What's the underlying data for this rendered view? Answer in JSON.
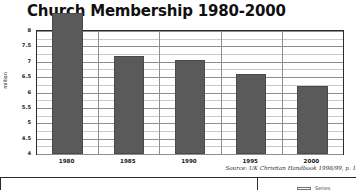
{
  "chart_data": {
    "type": "bar",
    "title": "Church Membership 1980-2000",
    "xlabel": "",
    "ylabel": "million",
    "categories": [
      "1980",
      "1985",
      "1990",
      "1995",
      "2000"
    ],
    "values": [
      8.6,
      7.2,
      7.05,
      6.6,
      6.2
    ],
    "ylim": [
      4,
      8
    ],
    "ytick_labels": [
      "8",
      "7.5",
      "7",
      "6.5",
      "6",
      "5.5",
      "5",
      "4.5",
      "4"
    ],
    "ytick_values": [
      8,
      7.5,
      7,
      6.5,
      6,
      5.5,
      5,
      4.5,
      4
    ],
    "minor_tick_step": 0.25,
    "grid": true,
    "legend": null,
    "bar_color": "#5a5a5a",
    "plot_border_color": "#2a2a2a",
    "grid_color": "#8e8e8e",
    "minor_grid_color": "#c9c9c9",
    "annotations": [
      "Source: UK Christian Handbook 1998/99, p. 1"
    ]
  },
  "source_note": "Source: UK Christian Handbook 1998/99, p. 1",
  "footer": {
    "legend_label": "Series"
  }
}
